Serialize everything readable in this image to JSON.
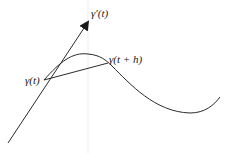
{
  "diagram": {
    "labels": {
      "tangent_vector": "γ′(t)",
      "point_t": "γ(t)",
      "point_t_plus_h": "γ(t + h)"
    },
    "colors": {
      "stroke": "#2a2a2a",
      "guide": "#ececec",
      "background": "#ffffff"
    },
    "geometry": {
      "point_t": [
        44,
        80
      ],
      "point_t_plus_h": [
        108,
        63
      ],
      "tangent_start": [
        8,
        143
      ],
      "tangent_tip": [
        89,
        20
      ],
      "curve_peak": [
        87,
        54
      ],
      "curve_min": [
        190,
        113
      ],
      "curve_end": [
        220,
        97
      ]
    }
  }
}
